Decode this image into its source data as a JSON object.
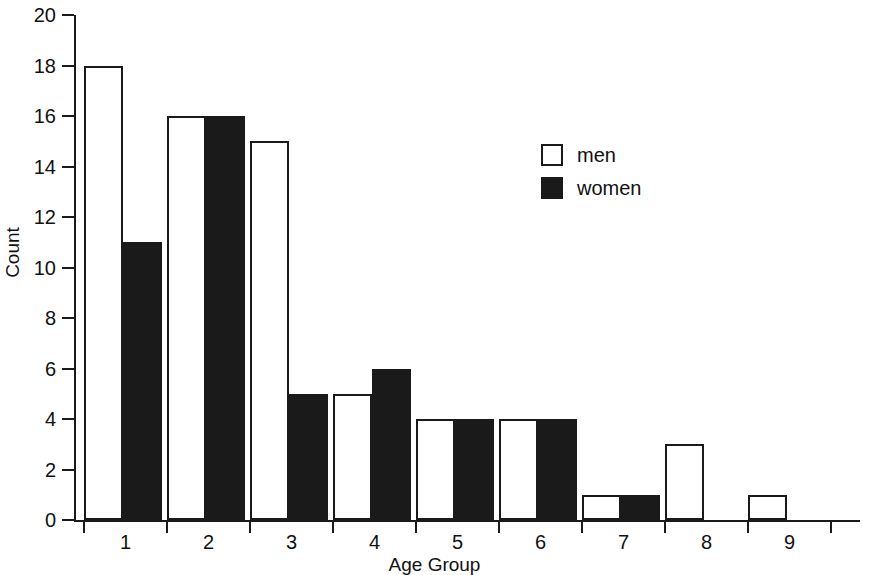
{
  "chart_data": {
    "type": "bar",
    "title": "",
    "subtitle": "",
    "xlabel": "Age Group",
    "ylabel": "Count",
    "categories": [
      "1",
      "2",
      "3",
      "4",
      "5",
      "6",
      "7",
      "8",
      "9"
    ],
    "series": [
      {
        "name": "men",
        "color": "#ffffff",
        "values": [
          18,
          16,
          15,
          5,
          4,
          4,
          1,
          3,
          1
        ]
      },
      {
        "name": "women",
        "color": "#1a1a1a",
        "values": [
          11,
          16,
          5,
          6,
          4,
          4,
          1,
          0,
          0
        ]
      }
    ],
    "ylim": [
      0,
      20
    ],
    "y_ticks": [
      0,
      2,
      4,
      6,
      8,
      10,
      12,
      14,
      16,
      18,
      20
    ],
    "y_tick_labels": [
      "0",
      "2",
      "4",
      "6",
      "8",
      "10",
      "12",
      "14",
      "16",
      "18",
      "20"
    ],
    "x_tick_labels": [
      "1",
      "2",
      "3",
      "4",
      "5",
      "6",
      "7",
      "8",
      "9"
    ],
    "grid": false,
    "legend_position": "upper-right",
    "legend_entries": [
      {
        "label": "men",
        "swatch": "white-square"
      },
      {
        "label": "women",
        "swatch": "black-square"
      }
    ],
    "annotations": [],
    "background_color": "#ffffff",
    "axis_color": "#1a1a1a"
  }
}
